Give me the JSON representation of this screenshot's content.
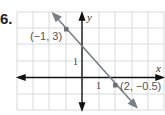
{
  "problem": {
    "number": "6."
  },
  "graph": {
    "x_axis_label": "x",
    "y_axis_label": "y",
    "x_tick_label": "1",
    "y_tick_label": "1",
    "points": [
      {
        "label": "(−1, 3)",
        "x": -1,
        "y": 3
      },
      {
        "label": "(2, −0.5)",
        "x": 2,
        "y": -0.5
      }
    ],
    "line": {
      "slope": -1.1667,
      "y_intercept": 1.8333
    },
    "colors": {
      "line": "#7a7f85",
      "grid": "#d9d9d9",
      "axes": "#111111",
      "point": "#6c7177"
    }
  }
}
